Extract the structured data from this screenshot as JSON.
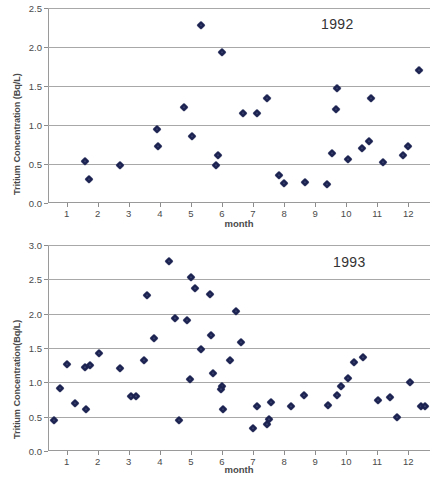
{
  "figures": [
    {
      "id": "1992",
      "ylabel": "Tritium Concentration (Bq/L)",
      "xlabel": "month",
      "annotation": "1992",
      "yticks": [
        "0.0",
        "0.5",
        "1.0",
        "1.5",
        "2.0",
        "2.5"
      ],
      "xticks": [
        "1",
        "2",
        "3",
        "4",
        "5",
        "6",
        "7",
        "8",
        "9",
        "10",
        "11",
        "12"
      ]
    },
    {
      "id": "1993",
      "ylabel": "Tritium Concentration(Bq/L)",
      "xlabel": "month",
      "annotation": "1993",
      "yticks": [
        "0.0",
        "0.5",
        "1.0",
        "1.5",
        "2.0",
        "2.5",
        "3.0"
      ],
      "xticks": [
        "1",
        "2",
        "3",
        "4",
        "5",
        "6",
        "7",
        "8",
        "9",
        "10",
        "11",
        "12"
      ]
    }
  ],
  "chart_data": [
    {
      "type": "scatter",
      "title": "1992",
      "xlabel": "month",
      "ylabel": "Tritium Concentration (Bq/L)",
      "xlim": [
        0.4,
        12.7
      ],
      "ylim": [
        0.0,
        2.5
      ],
      "ytick_values": [
        0.0,
        0.5,
        1.0,
        1.5,
        2.0,
        2.5
      ],
      "xtick_values": [
        1,
        2,
        3,
        4,
        5,
        6,
        7,
        8,
        9,
        10,
        11,
        12
      ],
      "grid": "horizontal",
      "legend": "none",
      "marker_color": "#1c2351",
      "points": [
        {
          "x": 1.6,
          "y": 0.54
        },
        {
          "x": 1.72,
          "y": 0.31
        },
        {
          "x": 2.72,
          "y": 0.49
        },
        {
          "x": 3.92,
          "y": 0.95
        },
        {
          "x": 3.93,
          "y": 0.73
        },
        {
          "x": 4.78,
          "y": 1.23
        },
        {
          "x": 5.05,
          "y": 0.86
        },
        {
          "x": 5.32,
          "y": 2.28
        },
        {
          "x": 5.8,
          "y": 0.49
        },
        {
          "x": 5.88,
          "y": 0.62
        },
        {
          "x": 6.0,
          "y": 1.94
        },
        {
          "x": 6.68,
          "y": 1.15
        },
        {
          "x": 7.12,
          "y": 1.15
        },
        {
          "x": 7.46,
          "y": 1.35
        },
        {
          "x": 7.85,
          "y": 0.36
        },
        {
          "x": 8.0,
          "y": 0.26
        },
        {
          "x": 8.66,
          "y": 0.27
        },
        {
          "x": 9.38,
          "y": 0.24
        },
        {
          "x": 9.55,
          "y": 0.64
        },
        {
          "x": 9.68,
          "y": 1.21
        },
        {
          "x": 9.72,
          "y": 1.48
        },
        {
          "x": 10.05,
          "y": 0.56
        },
        {
          "x": 10.52,
          "y": 0.71
        },
        {
          "x": 10.72,
          "y": 0.79
        },
        {
          "x": 10.8,
          "y": 1.34
        },
        {
          "x": 11.2,
          "y": 0.52
        },
        {
          "x": 11.82,
          "y": 0.61
        },
        {
          "x": 12.0,
          "y": 0.73
        },
        {
          "x": 12.35,
          "y": 1.71
        }
      ]
    },
    {
      "type": "scatter",
      "title": "1993",
      "xlabel": "month",
      "ylabel": "Tritium Concentration(Bq/L)",
      "xlim": [
        0.4,
        12.7
      ],
      "ylim": [
        0.0,
        3.0
      ],
      "ytick_values": [
        0.0,
        0.5,
        1.0,
        1.5,
        2.0,
        2.5,
        3.0
      ],
      "xtick_values": [
        1,
        2,
        3,
        4,
        5,
        6,
        7,
        8,
        9,
        10,
        11,
        12
      ],
      "grid": "horizontal",
      "legend": "none",
      "marker_color": "#1c2351",
      "points": [
        {
          "x": 0.58,
          "y": 0.45
        },
        {
          "x": 0.78,
          "y": 0.92
        },
        {
          "x": 1.0,
          "y": 1.27
        },
        {
          "x": 1.28,
          "y": 0.7
        },
        {
          "x": 1.58,
          "y": 1.23
        },
        {
          "x": 1.62,
          "y": 0.61
        },
        {
          "x": 1.76,
          "y": 1.25
        },
        {
          "x": 2.05,
          "y": 1.43
        },
        {
          "x": 2.72,
          "y": 1.21
        },
        {
          "x": 3.08,
          "y": 0.8
        },
        {
          "x": 3.22,
          "y": 0.8
        },
        {
          "x": 3.5,
          "y": 1.32
        },
        {
          "x": 3.58,
          "y": 2.27
        },
        {
          "x": 3.82,
          "y": 1.65
        },
        {
          "x": 4.3,
          "y": 2.76
        },
        {
          "x": 4.48,
          "y": 1.93
        },
        {
          "x": 4.62,
          "y": 0.45
        },
        {
          "x": 4.88,
          "y": 1.91
        },
        {
          "x": 5.0,
          "y": 2.54
        },
        {
          "x": 4.98,
          "y": 1.05
        },
        {
          "x": 5.12,
          "y": 2.38
        },
        {
          "x": 5.32,
          "y": 1.48
        },
        {
          "x": 5.62,
          "y": 2.29
        },
        {
          "x": 5.66,
          "y": 1.69
        },
        {
          "x": 5.7,
          "y": 1.14
        },
        {
          "x": 6.0,
          "y": 0.95
        },
        {
          "x": 5.98,
          "y": 0.9
        },
        {
          "x": 6.05,
          "y": 0.61
        },
        {
          "x": 6.25,
          "y": 1.33
        },
        {
          "x": 6.45,
          "y": 2.04
        },
        {
          "x": 6.62,
          "y": 1.59
        },
        {
          "x": 7.0,
          "y": 0.33
        },
        {
          "x": 7.12,
          "y": 0.65
        },
        {
          "x": 7.45,
          "y": 0.39
        },
        {
          "x": 7.5,
          "y": 0.46
        },
        {
          "x": 7.58,
          "y": 0.72
        },
        {
          "x": 8.22,
          "y": 0.66
        },
        {
          "x": 8.65,
          "y": 0.81
        },
        {
          "x": 9.4,
          "y": 0.67
        },
        {
          "x": 9.72,
          "y": 0.82
        },
        {
          "x": 9.85,
          "y": 0.94
        },
        {
          "x": 10.05,
          "y": 1.06
        },
        {
          "x": 10.25,
          "y": 1.3
        },
        {
          "x": 10.55,
          "y": 1.37
        },
        {
          "x": 11.02,
          "y": 0.74
        },
        {
          "x": 11.42,
          "y": 0.78
        },
        {
          "x": 11.65,
          "y": 0.5
        },
        {
          "x": 12.05,
          "y": 1.01
        },
        {
          "x": 12.42,
          "y": 0.66
        },
        {
          "x": 12.55,
          "y": 0.66
        }
      ]
    }
  ]
}
